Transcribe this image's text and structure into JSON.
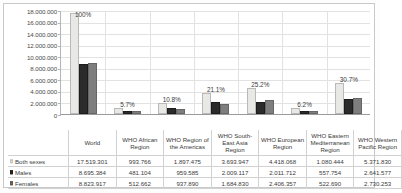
{
  "chart_data": {
    "type": "bar",
    "title": "",
    "subtitle": "",
    "xlabel": "",
    "ylabel": "",
    "ylim": [
      0,
      18000000
    ],
    "ytick_step": 2000000,
    "grid": true,
    "legend_position": "table-row-labels",
    "yticks": [
      "18.000.000",
      "16.000.000",
      "14.000.000",
      "12.000.000",
      "10.000.000",
      "8.000.000",
      "6.000.000",
      "4.000.000",
      "2.000.000",
      "0"
    ],
    "categories": [
      "World",
      "WHO African Region",
      "WHO Region of the Americas",
      "WHO South-East Asia Region",
      "WHO European Region",
      "WHO Eastern Mediterranean Region",
      "WHO Western Pacific Region"
    ],
    "annotations": [
      "100%",
      "5.7%",
      "10.8%",
      "21.1%",
      "25.2%",
      "6.2%",
      "30.7%"
    ],
    "series": [
      {
        "name": "Both sexes",
        "color": "#e8e8e6",
        "values": [
          17519301,
          993766,
          1897475,
          3693947,
          4418068,
          1080444,
          5371830
        ]
      },
      {
        "name": "Males",
        "color": "#2b2b2b",
        "values": [
          8695384,
          481104,
          959585,
          2009117,
          2011712,
          557754,
          2641577
        ]
      },
      {
        "name": "Females",
        "color": "#7e7e7e",
        "values": [
          8823917,
          512662,
          937890,
          1684830,
          2406357,
          522690,
          2730253
        ]
      }
    ]
  },
  "table": {
    "corner_label": "",
    "columns": [
      "World",
      "WHO African Region",
      "WHO Region of the Americas",
      "WHO South-East Asia Region",
      "WHO European Region",
      "WHO Eastern Mediterranean Region",
      "WHO Western Pacific Region"
    ],
    "rows": [
      {
        "label": "Both sexes",
        "swatch": "sw-both",
        "cells": [
          "17.519.301",
          "993.766",
          "1.897.475",
          "3.693.947",
          "4.418.068",
          "1.080.444",
          "5.371.830"
        ]
      },
      {
        "label": "Males",
        "swatch": "sw-males",
        "cells": [
          "8.695.384",
          "481.104",
          "959.585",
          "2.009.117",
          "2.011.712",
          "557.754",
          "2.641.577"
        ]
      },
      {
        "label": "Females",
        "swatch": "sw-females",
        "cells": [
          "8.823.917",
          "512.662",
          "937.890",
          "1.684.830",
          "2.406.357",
          "522.690",
          "2.730.253"
        ]
      }
    ]
  }
}
